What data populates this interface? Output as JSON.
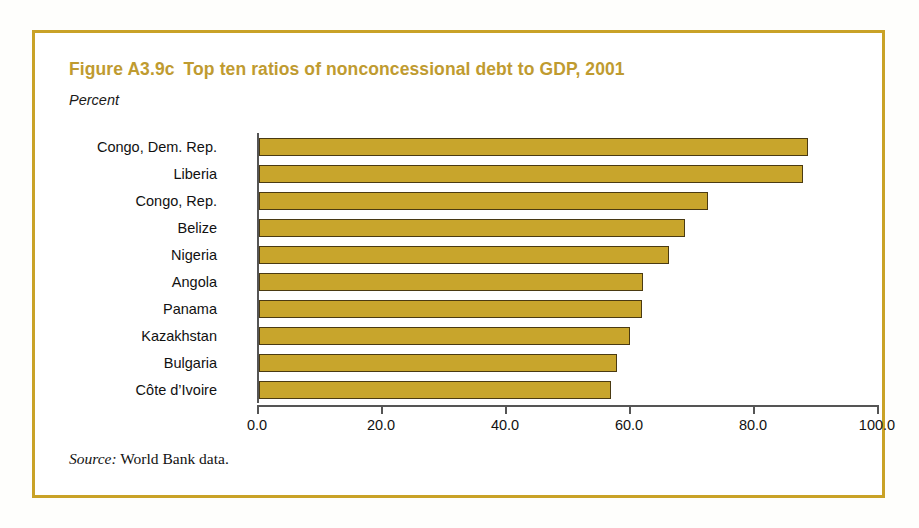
{
  "figure": {
    "number": "Figure A3.9c",
    "title": "Top ten ratios of nonconcessional debt to GDP, 2001",
    "subtitle": "Percent",
    "source_lead": "Source:",
    "source_text": " World Bank data.",
    "border_color": "#c9a227",
    "title_color": "#bf9b30",
    "bar_fill_color": "#c8a52c",
    "bar_edge_color": "#4a3a12"
  },
  "chart_data": {
    "type": "bar",
    "orientation": "horizontal",
    "title": "Top ten ratios of nonconcessional debt to GDP, 2001",
    "subtitle": "Percent",
    "xlabel": "",
    "ylabel": "",
    "xlim": [
      0.0,
      100.0
    ],
    "xticks": [
      0.0,
      20.0,
      40.0,
      60.0,
      80.0,
      100.0
    ],
    "xtick_labels": [
      "0.0",
      "20.0",
      "40.0",
      "60.0",
      "80.0",
      "100.0"
    ],
    "grid": false,
    "legend": false,
    "categories": [
      "Congo, Dem. Rep.",
      "Liberia",
      "Congo, Rep.",
      "Belize",
      "Nigeria",
      "Angola",
      "Panama",
      "Kazakhstan",
      "Bulgaria",
      "Côte d’Ivoire"
    ],
    "values": [
      88.6,
      87.8,
      72.4,
      68.7,
      66.2,
      62.0,
      61.8,
      59.8,
      57.8,
      56.8
    ],
    "source": "Source: World Bank data."
  }
}
